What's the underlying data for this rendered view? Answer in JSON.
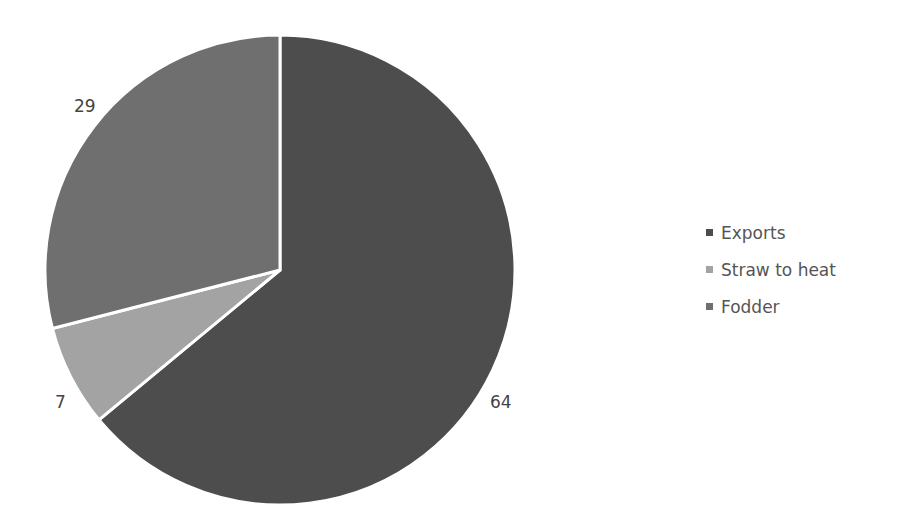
{
  "chart_data": {
    "type": "pie",
    "title": "",
    "categories": [
      "Exports",
      "Straw to heat",
      "Fodder"
    ],
    "values": [
      64,
      7,
      29
    ],
    "colors": [
      "#4d4d4d",
      "#a3a3a3",
      "#6f6f6f"
    ],
    "legend_position": "right",
    "data_labels": [
      "64",
      "7",
      "29"
    ]
  },
  "legend": {
    "items": [
      {
        "label": "Exports",
        "color": "#4d4d4d"
      },
      {
        "label": "Straw to heat",
        "color": "#a3a3a3"
      },
      {
        "label": "Fodder",
        "color": "#6f6f6f"
      }
    ]
  },
  "labels": {
    "exports": "64",
    "straw": "7",
    "fodder": "29"
  }
}
